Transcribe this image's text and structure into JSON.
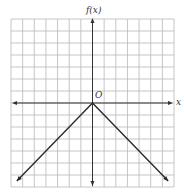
{
  "chart_data": {
    "type": "line",
    "title": "",
    "xlabel": "x",
    "ylabel": "f(x)",
    "origin_label": "O",
    "xlim": [
      -7,
      7
    ],
    "ylim": [
      -7,
      7
    ],
    "grid": true,
    "grid_step": 1,
    "legend": null,
    "series": [
      {
        "name": "f(x) = -|x|",
        "x": [
          -6.5,
          0,
          6.5
        ],
        "y": [
          -6.5,
          0,
          -6.5
        ],
        "arrows_at_ends": true
      }
    ]
  },
  "colors": {
    "grid": "#b8b8b8",
    "axis": "#333333",
    "line": "#2a2a2a",
    "background": "#ffffff"
  }
}
